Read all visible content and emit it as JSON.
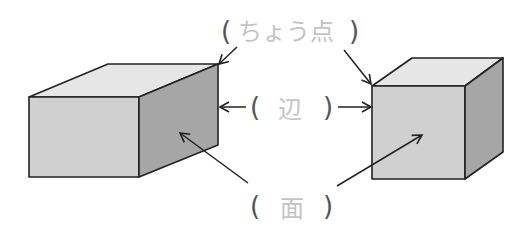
{
  "diagram": {
    "labels": {
      "vertex": {
        "open": "(",
        "text": "ちょう点",
        "close": ")"
      },
      "edge": {
        "open": "(",
        "text": "辺",
        "close": ")"
      },
      "face": {
        "open": "(",
        "text": "面",
        "close": ")"
      }
    },
    "shapes": [
      {
        "name": "rectangular-prism",
        "faces": [
          "top",
          "front",
          "side"
        ]
      },
      {
        "name": "cube",
        "faces": [
          "top",
          "front",
          "side"
        ]
      }
    ],
    "colors": {
      "top_face": "#e6e6e6",
      "front_face": "#d0d0d0",
      "side_face": "#a6a6a6",
      "outline": "#222222",
      "answer_text": "#c4c4c4",
      "parentheses": "#555555"
    }
  }
}
